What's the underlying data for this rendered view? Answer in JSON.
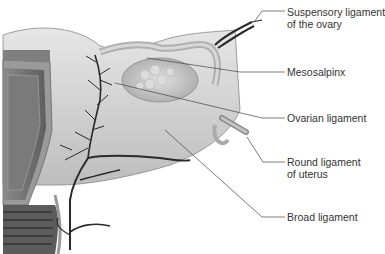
{
  "figure": {
    "colors": {
      "tissue_light": "#d9d9d9",
      "tissue_mid": "#b8b8b8",
      "tissue_dark": "#6e6e6e",
      "vessel": "#2a2a2a",
      "leader_line": "#444444",
      "text": "#333333"
    }
  },
  "labels": [
    {
      "id": "suspensory",
      "line1": "Suspensory ligament",
      "line2": "of the ovary"
    },
    {
      "id": "mesosalpinx",
      "line1": "Mesosalpinx"
    },
    {
      "id": "ovarian",
      "line1": "Ovarian ligament"
    },
    {
      "id": "round",
      "line1": "Round ligament",
      "line2": "of uterus"
    },
    {
      "id": "broad",
      "line1": "Broad ligament"
    }
  ]
}
